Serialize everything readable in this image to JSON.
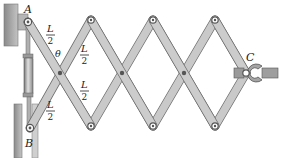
{
  "diagram": {
    "labels": {
      "point_a": "A",
      "point_b": "B",
      "point_c": "C",
      "angle": "θ",
      "half_length_num": "L",
      "half_length_den": "2"
    },
    "colors": {
      "link_fill": "#c9c9c9",
      "link_stroke": "#6e6e6e",
      "wall": "#9a9a9a",
      "cylinder": "#a8a8a8",
      "pin": "#555555",
      "text": "#222222"
    }
  }
}
